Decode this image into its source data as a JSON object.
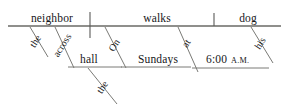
{
  "diagram": {
    "kind": "reed-kellogg-sentence-diagram",
    "sentence": "The neighbor across the hall walks on Sundays at 6:00 A.M. his dog",
    "colors": {
      "background": "#ffffff",
      "line": "#5a5a58",
      "text": "#17171a"
    },
    "baseline": {
      "label": "main-horizontal-line",
      "y": 26,
      "x_start": 8,
      "x_end": 281
    },
    "dividers": [
      {
        "name": "subject-verb-divider",
        "x": 90,
        "y_top": 12,
        "y_bottom": 38,
        "crosses": true
      },
      {
        "name": "verb-object-divider",
        "x": 214,
        "y_top": 13,
        "y_bottom": 26,
        "crosses": false
      }
    ],
    "baseline_words": [
      {
        "id": "subject",
        "label": "neighbor",
        "x": 52,
        "y": 22
      },
      {
        "id": "verb",
        "label": "walks",
        "x": 157,
        "y": 22
      },
      {
        "id": "direct-object",
        "label": "dog",
        "x": 248,
        "y": 22
      }
    ],
    "modifiers": [
      {
        "id": "article-the-subject",
        "label": "the",
        "x": 38,
        "y": 43,
        "angle": -58
      },
      {
        "id": "preposition-across",
        "label": "across",
        "x": 64,
        "y": 45,
        "angle": -58
      },
      {
        "id": "object-hall",
        "label": "hall",
        "x": 88,
        "y": 63,
        "angle": 0
      },
      {
        "id": "article-the-hall",
        "label": "the",
        "x": 108,
        "y": 86,
        "angle": -58
      },
      {
        "id": "preposition-on",
        "label": "On",
        "x": 118,
        "y": 45,
        "angle": -58
      },
      {
        "id": "object-sundays",
        "label": "Sundays",
        "x": 158,
        "y": 63,
        "angle": 0
      },
      {
        "id": "preposition-at",
        "label": "at",
        "x": 189,
        "y": 44,
        "angle": -58
      },
      {
        "id": "object-time",
        "label": "6:00",
        "x": 216,
        "y": 63,
        "angle": 0
      },
      {
        "id": "object-time-meridiem",
        "label": "A.M.",
        "x": 238,
        "y": 63,
        "angle": 0
      },
      {
        "id": "possessive-his",
        "label": "his",
        "x": 264,
        "y": 44,
        "angle": -58
      }
    ],
    "modifier_lines": [
      {
        "name": "the-subject-slant",
        "x1": 30,
        "y1": 27,
        "x2": 48,
        "y2": 57
      },
      {
        "name": "across-slant",
        "x1": 55,
        "y1": 27,
        "x2": 74,
        "y2": 68
      },
      {
        "name": "hall-line",
        "x1": 68,
        "y1": 67,
        "x2": 122,
        "y2": 67
      },
      {
        "name": "the-hall-slant",
        "x1": 88,
        "y1": 68,
        "x2": 117,
        "y2": 104
      },
      {
        "name": "on-slant",
        "x1": 105,
        "y1": 27,
        "x2": 126,
        "y2": 68
      },
      {
        "name": "sundays-line",
        "x1": 121,
        "y1": 67,
        "x2": 191,
        "y2": 67
      },
      {
        "name": "at-slant",
        "x1": 178,
        "y1": 27,
        "x2": 198,
        "y2": 72
      },
      {
        "name": "time-line",
        "x1": 192,
        "y1": 68,
        "x2": 269,
        "y2": 68
      },
      {
        "name": "his-slant",
        "x1": 251,
        "y1": 27,
        "x2": 273,
        "y2": 63
      }
    ]
  }
}
